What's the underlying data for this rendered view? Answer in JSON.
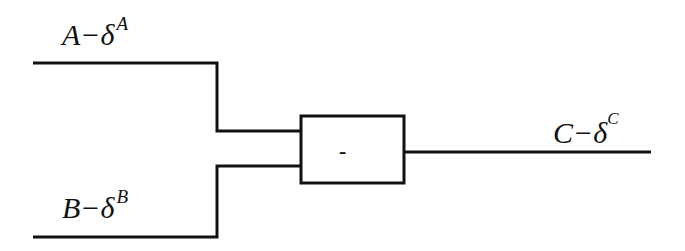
{
  "diagram": {
    "type": "block-diagram",
    "inputs": [
      {
        "id": "A",
        "base": "A",
        "dash": "−",
        "delta": "δ",
        "superscript": "A"
      },
      {
        "id": "B",
        "base": "B",
        "dash": "−",
        "delta": "δ",
        "superscript": "B"
      }
    ],
    "operator_block": {
      "symbol": "-"
    },
    "output": {
      "id": "C",
      "base": "C",
      "dash": "−",
      "delta": "δ",
      "superscript": "C"
    },
    "stroke_color": "#111111"
  }
}
